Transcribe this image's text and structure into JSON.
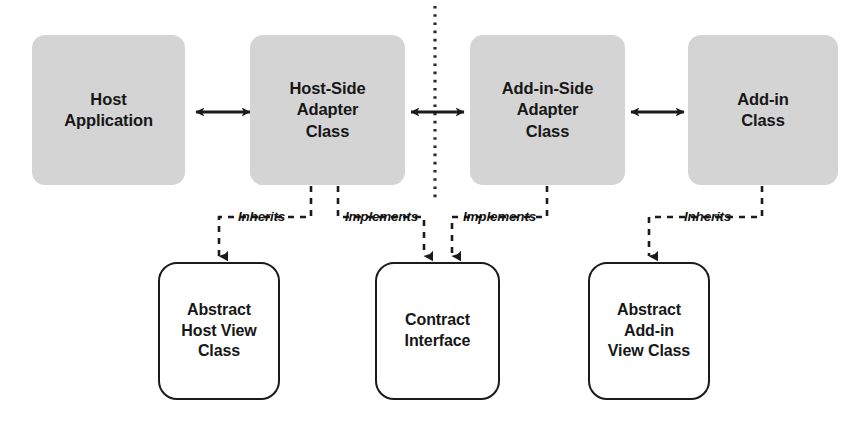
{
  "diagram": {
    "colors": {
      "node_fill_top": "#d4d4d4",
      "node_fill_bottom": "#ffffff",
      "stroke": "#1b1b1b",
      "text": "#171717",
      "background": "#ffffff"
    },
    "top_row": [
      {
        "id": "host-application",
        "label": "Host\nApplication"
      },
      {
        "id": "host-side-adapter-class",
        "label": "Host-Side\nAdapter\nClass"
      },
      {
        "id": "add-in-side-adapter-class",
        "label": "Add-in-Side\nAdapter\nClass"
      },
      {
        "id": "add-in-class",
        "label": "Add-in\nClass"
      }
    ],
    "bottom_row": [
      {
        "id": "abstract-host-view-class",
        "label": "Abstract\nHost View\nClass"
      },
      {
        "id": "contract-interface",
        "label": "Contract\nInterface"
      },
      {
        "id": "abstract-add-in-view-class",
        "label": "Abstract\nAdd-in\nView Class"
      }
    ],
    "connectors": [
      {
        "id": "host-app-to-host-side-adapter",
        "kind": "double-arrow",
        "from": "host-application",
        "to": "host-side-adapter-class"
      },
      {
        "id": "host-side-adapter-to-add-in-side-adapter",
        "kind": "double-arrow",
        "from": "host-side-adapter-class",
        "to": "add-in-side-adapter-class"
      },
      {
        "id": "add-in-side-adapter-to-add-in",
        "kind": "double-arrow",
        "from": "add-in-side-adapter-class",
        "to": "add-in-class"
      }
    ],
    "edge_labels": [
      {
        "id": "inherits-host-view",
        "text": "Inherits",
        "from": "host-side-adapter-class",
        "to": "abstract-host-view-class"
      },
      {
        "id": "implements-contract-left",
        "text": "Implements",
        "from": "host-side-adapter-class",
        "to": "contract-interface"
      },
      {
        "id": "implements-contract-right",
        "text": "Implements",
        "from": "add-in-side-adapter-class",
        "to": "contract-interface"
      },
      {
        "id": "inherits-add-in-view",
        "text": "Inherits",
        "from": "add-in-side-adapter-class",
        "to": "abstract-add-in-view-class"
      }
    ],
    "boundary": {
      "id": "isolation-boundary",
      "style": "dotted-vertical-line"
    }
  }
}
